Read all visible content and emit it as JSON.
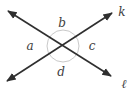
{
  "diagram": {
    "type": "intersecting-lines-geometry",
    "background_color": "#ffffff",
    "line_color": "#2f2f2f",
    "circle_color": "#c9c9c9",
    "label_color": "#3d3d3d",
    "angle_labels": {
      "left": "a",
      "top": "b",
      "right": "c",
      "bottom": "d"
    },
    "line_labels": {
      "up_right_line": "k",
      "down_right_line": "ℓ"
    }
  }
}
